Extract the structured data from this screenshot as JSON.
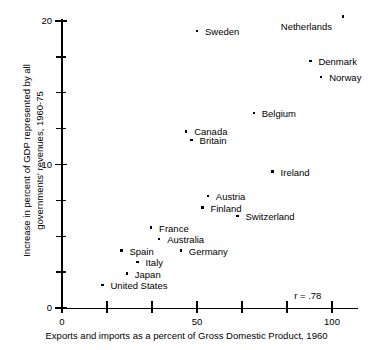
{
  "chart_data": {
    "type": "scatter",
    "title": "",
    "xlabel": "Exports and imports as a percent of Gross Domestic Product, 1960",
    "ylabel": "Increase in percent of GDP represented by all governments' revenues, 1960-75",
    "xlim": [
      0,
      110
    ],
    "ylim": [
      0,
      20.5
    ],
    "grid": false,
    "legend": null,
    "annotation": "r = .78",
    "correlation": 0.78,
    "x_ticks": [
      0,
      16.7,
      33.3,
      50,
      66.7,
      83.3,
      100
    ],
    "x_tick_labels": [
      "0",
      "",
      "",
      "50",
      "",
      "",
      "100"
    ],
    "y_ticks": [
      0,
      2.5,
      5,
      7.5,
      10,
      12.5,
      15,
      17.5,
      20
    ],
    "y_tick_labels": [
      "0",
      "",
      "",
      "",
      "10",
      "",
      "",
      "",
      "20"
    ],
    "points": [
      {
        "label": "Netherlands",
        "x": 104.0,
        "y": 20.3,
        "label_dx": -62,
        "label_dy": 9
      },
      {
        "label": "Sweden",
        "x": 50.0,
        "y": 19.3,
        "label_dx": 8,
        "label_dy": 0
      },
      {
        "label": "Denmark",
        "x": 92.0,
        "y": 17.2,
        "label_dx": 8,
        "label_dy": 0
      },
      {
        "label": "Norway",
        "x": 96.0,
        "y": 16.1,
        "label_dx": 8,
        "label_dy": 0
      },
      {
        "label": "Belgium",
        "x": 71.0,
        "y": 13.6,
        "label_dx": 8,
        "label_dy": 0
      },
      {
        "label": "Canada",
        "x": 46.0,
        "y": 12.3,
        "label_dx": 8,
        "label_dy": 0
      },
      {
        "label": "Britain",
        "x": 48.0,
        "y": 11.7,
        "label_dx": 8,
        "label_dy": 0
      },
      {
        "label": "Ireland",
        "x": 78.0,
        "y": 9.5,
        "label_dx": 8,
        "label_dy": 0
      },
      {
        "label": "Austria",
        "x": 54.0,
        "y": 7.8,
        "label_dx": 8,
        "label_dy": 0
      },
      {
        "label": "Finland",
        "x": 52.0,
        "y": 7.0,
        "label_dx": 8,
        "label_dy": 0
      },
      {
        "label": "Switzerland",
        "x": 65.0,
        "y": 6.4,
        "label_dx": 8,
        "label_dy": 0
      },
      {
        "label": "France",
        "x": 33.0,
        "y": 5.6,
        "label_dx": 8,
        "label_dy": 0
      },
      {
        "label": "Australia",
        "x": 36.0,
        "y": 4.8,
        "label_dx": 8,
        "label_dy": 0
      },
      {
        "label": "Spain",
        "x": 22.0,
        "y": 4.0,
        "label_dx": 8,
        "label_dy": 0
      },
      {
        "label": "Germany",
        "x": 44.0,
        "y": 4.0,
        "label_dx": 8,
        "label_dy": 0
      },
      {
        "label": "Italy",
        "x": 28.0,
        "y": 3.2,
        "label_dx": 8,
        "label_dy": 0
      },
      {
        "label": "Japan",
        "x": 24.0,
        "y": 2.4,
        "label_dx": 8,
        "label_dy": 0
      },
      {
        "label": "United States",
        "x": 15.0,
        "y": 1.6,
        "label_dx": 8,
        "label_dy": 0
      }
    ]
  },
  "colors": {
    "axis": "#000000",
    "marker": "#000000",
    "background": "#ffffff",
    "text": "#000000"
  }
}
